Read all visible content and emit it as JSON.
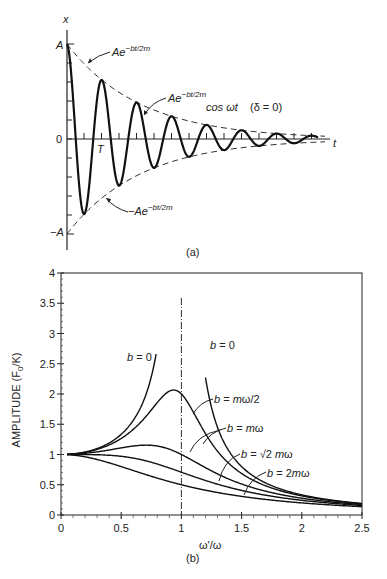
{
  "figure_a": {
    "caption": "(a)",
    "y_axis_label": "x",
    "x_axis_label": "t",
    "y_ticks": {
      "top": "A",
      "zero": "0",
      "bottom": "−A"
    },
    "period_label": "T",
    "labels": {
      "upper_envelope": {
        "base": "Ae",
        "exp": "−bt/2m"
      },
      "signal": {
        "base": "Ae",
        "exp": "−bt/2m",
        "tail": "cos ωt",
        "note": "(δ = 0)"
      },
      "lower_envelope": {
        "base": "−Ae",
        "exp": "−bt/2m"
      }
    }
  },
  "figure_b": {
    "caption": "(b)"
  },
  "chart_data": [
    {
      "type": "line",
      "title": "Damped oscillation",
      "xlabel": "t",
      "ylabel": "x",
      "series": [
        {
          "name": "Ae^{-bt/2m} cos ωt (δ = 0)",
          "style": "solid",
          "initial_amplitude": "A",
          "decay_ratio_per_period": 0.62,
          "periods_shown": 7
        },
        {
          "name": "Ae^{-bt/2m}",
          "style": "dashed"
        },
        {
          "name": "-Ae^{-bt/2m}",
          "style": "dashed"
        }
      ],
      "annotations": [
        "T (period)"
      ]
    },
    {
      "type": "line",
      "title": "",
      "xlabel": "ω'/ω",
      "ylabel": "AMPLITUDE (F₀/K)",
      "xlim": [
        0,
        2.5
      ],
      "ylim": [
        0,
        4
      ],
      "x_ticks": [
        "0",
        "0.5",
        "1",
        "1.5",
        "2",
        "2.5"
      ],
      "y_ticks": [
        "0",
        "0.5",
        "1",
        "1.5",
        "2",
        "2.5",
        "3",
        "3.5",
        "4"
      ],
      "grid": false,
      "reference_line": {
        "x": 1,
        "style": "dash-dot"
      },
      "series": [
        {
          "name": "b = 0",
          "label": "b = 0",
          "gamma": 0,
          "x": [
            0.05,
            0.3,
            0.5,
            0.6,
            0.7,
            0.8
          ],
          "values": [
            1.0,
            1.1,
            1.33,
            1.56,
            1.96,
            2.7
          ]
        },
        {
          "name": "b = 0 (above resonance)",
          "label": "b = 0",
          "gamma": 0,
          "x": [
            1.2,
            1.5,
            2.0,
            2.5
          ],
          "values": [
            3.4,
            0.8,
            0.33,
            0.19
          ]
        },
        {
          "name": "b = mω/2",
          "label": "b = mω/2",
          "gamma": 0.5,
          "x": [
            0.05,
            0.5,
            0.8,
            0.9,
            1.0,
            1.5,
            2.0,
            2.5
          ],
          "values": [
            1.0,
            1.28,
            1.9,
            2.0,
            2.0,
            0.69,
            0.31,
            0.18
          ]
        },
        {
          "name": "b = mω",
          "label": "b = mω",
          "gamma": 1.0,
          "x": [
            0.05,
            0.5,
            0.71,
            1.0,
            1.5,
            2.0,
            2.5
          ],
          "values": [
            1.0,
            1.11,
            1.15,
            1.0,
            0.55,
            0.28,
            0.17
          ]
        },
        {
          "name": "b = √2 mω",
          "label": "b = √2 mω",
          "gamma": 1.414,
          "x": [
            0.05,
            0.5,
            1.0,
            1.5,
            2.0,
            2.5
          ],
          "values": [
            1.0,
            0.97,
            0.71,
            0.45,
            0.26,
            0.16
          ]
        },
        {
          "name": "b = 2mω",
          "label": "b = 2mω",
          "gamma": 2.0,
          "x": [
            0.05,
            0.5,
            1.0,
            1.5,
            2.0,
            2.5
          ],
          "values": [
            1.0,
            0.8,
            0.5,
            0.36,
            0.22,
            0.14
          ]
        }
      ]
    }
  ]
}
